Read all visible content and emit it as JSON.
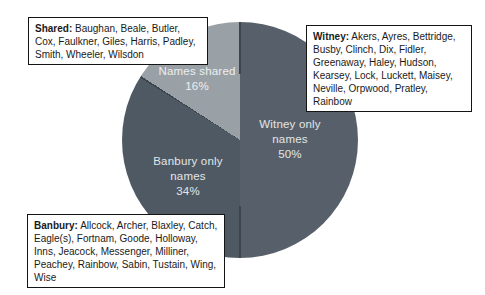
{
  "chart_data": {
    "type": "pie",
    "title": "",
    "categories": [
      "Witney only names",
      "Banbury only names",
      "Names shared"
    ],
    "values": [
      50,
      34,
      16
    ],
    "slices": [
      {
        "name": "Witney only names",
        "value": 50,
        "color": "#57606a",
        "label_lines": [
          "Witney only",
          "names",
          "50%"
        ]
      },
      {
        "name": "Banbury only names",
        "value": 34,
        "color": "#4e5963",
        "label_lines": [
          "Banbury only",
          "names",
          "34%"
        ]
      },
      {
        "name": "Names shared",
        "value": 16,
        "color": "#9aa1a6",
        "label_lines": [
          "Names shared",
          "16%"
        ]
      }
    ],
    "start_angle_deg": 0,
    "direction": "clockwise",
    "divider_color": "#3d454c",
    "label_color": "#e3e6e8",
    "legend": "none",
    "background": "#ffffff"
  },
  "annotations": {
    "shared": {
      "label": "Shared:",
      "names": " Baughan, Beale, Butler, Cox, Faulkner, Giles, Harris, Padley, Smith, Wheeler, Wilsdon"
    },
    "witney": {
      "label": "Witney:",
      "names": " Akers, Ayres, Bettridge, Busby, Clinch, Dix, Fidler, Greenaway, Haley, Hudson, Kearsey, Lock, Luckett, Maisey, Neville, Orpwood, Pratley, Rainbow"
    },
    "banbury": {
      "label": "Banbury:",
      "names": " Allcock, Archer, Blaxley, Catch, Eagle(s), Fortnam, Goode, Holloway, Inns, Jeacock, Messenger, Milliner, Peachey, Rainbow, Sabin, Tustain, Wing, Wise"
    }
  }
}
